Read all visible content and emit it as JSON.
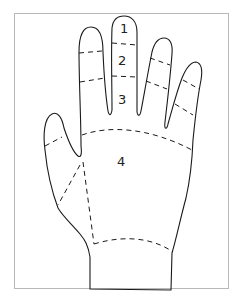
{
  "diagram": {
    "zones": [
      {
        "id": 1,
        "label": "1",
        "location": "middle finger distal segment"
      },
      {
        "id": 2,
        "label": "2",
        "location": "middle finger middle segment"
      },
      {
        "id": 3,
        "label": "3",
        "location": "middle finger proximal segment"
      },
      {
        "id": 4,
        "label": "4",
        "location": "palm"
      }
    ],
    "colors": {
      "line": "#1a1a1a",
      "frame": "#b8b8b8",
      "background": "#ffffff"
    }
  }
}
